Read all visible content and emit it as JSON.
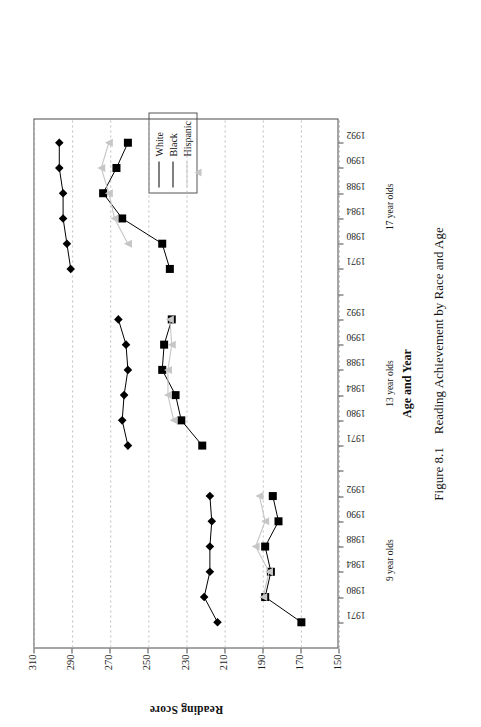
{
  "figure": {
    "number": "Figure 8.1",
    "caption": "Reading Achievement by Race and Age"
  },
  "legend": {
    "title": "",
    "items": [
      {
        "label": "White",
        "marker": "diamond-marker",
        "color": "#000000"
      },
      {
        "label": "Black",
        "marker": "square-marker",
        "color": "#000000"
      },
      {
        "label": "Hispanic",
        "marker": "triangle-marker",
        "color": "#c6c6c6"
      }
    ]
  },
  "axes": {
    "y_title": "Reading Score",
    "x_title": "Age and Year",
    "y_ticks": [
      "150",
      "170",
      "190",
      "210",
      "230",
      "250",
      "270",
      "290",
      "310"
    ],
    "groups": [
      "9 year olds",
      "13 year olds",
      "17 year olds"
    ],
    "years": [
      "1971",
      "1980",
      "1984",
      "1988",
      "1990",
      "1992"
    ]
  },
  "chart_data": {
    "type": "line",
    "title": "Reading Achievement by Race and Age",
    "xlabel": "Age and Year",
    "ylabel": "Reading Score",
    "ylim": [
      150,
      310
    ],
    "ytick_step": 20,
    "grid": "dotted horizontal gridlines at every score tick",
    "legend_position": "above plot, centered-right",
    "groups": [
      "9 year olds",
      "13 year olds",
      "17 year olds"
    ],
    "categories": [
      "9 year olds 1971",
      "9 year olds 1980",
      "9 year olds 1984",
      "9 year olds 1988",
      "9 year olds 1990",
      "9 year olds 1992",
      "13 year olds 1971",
      "13 year olds 1980",
      "13 year olds 1984",
      "13 year olds 1988",
      "13 year olds 1990",
      "13 year olds 1992",
      "17 year olds 1971",
      "17 year olds 1980",
      "17 year olds 1984",
      "17 year olds 1988",
      "17 year olds 1990",
      "17 year olds 1992"
    ],
    "series": [
      {
        "name": "White",
        "marker": "diamond",
        "color": "#000000",
        "groups": {
          "9 year olds": {
            "1971": 214,
            "1980": 221,
            "1984": 218,
            "1988": 218,
            "1990": 217,
            "1992": 218
          },
          "13 year olds": {
            "1971": 261,
            "1980": 264,
            "1984": 263,
            "1988": 261,
            "1990": 262,
            "1992": 266
          },
          "17 year olds": {
            "1971": 291,
            "1980": 293,
            "1984": 295,
            "1988": 295,
            "1990": 297,
            "1992": 297
          }
        }
      },
      {
        "name": "Black",
        "marker": "square",
        "color": "#000000",
        "groups": {
          "9 year olds": {
            "1971": 170,
            "1980": 189,
            "1984": 186,
            "1988": 189,
            "1990": 182,
            "1992": 185
          },
          "13 year olds": {
            "1971": 222,
            "1980": 233,
            "1984": 236,
            "1988": 243,
            "1990": 242,
            "1992": 238
          },
          "17 year olds": {
            "1971": 239,
            "1980": 243,
            "1984": 264,
            "1988": 274,
            "1990": 267,
            "1992": 261
          }
        }
      },
      {
        "name": "Hispanic",
        "marker": "triangle",
        "color": "#c6c6c6",
        "groups": {
          "9 year olds": {
            "1971": null,
            "1980": 190,
            "1984": 187,
            "1988": 194,
            "1990": 189,
            "1992": 192
          },
          "13 year olds": {
            "1971": null,
            "1980": 237,
            "1984": 240,
            "1988": 240,
            "1990": 238,
            "1992": 239
          },
          "17 year olds": {
            "1971": null,
            "1980": 261,
            "1984": 268,
            "1988": 271,
            "1990": 275,
            "1992": 271
          }
        }
      }
    ]
  }
}
